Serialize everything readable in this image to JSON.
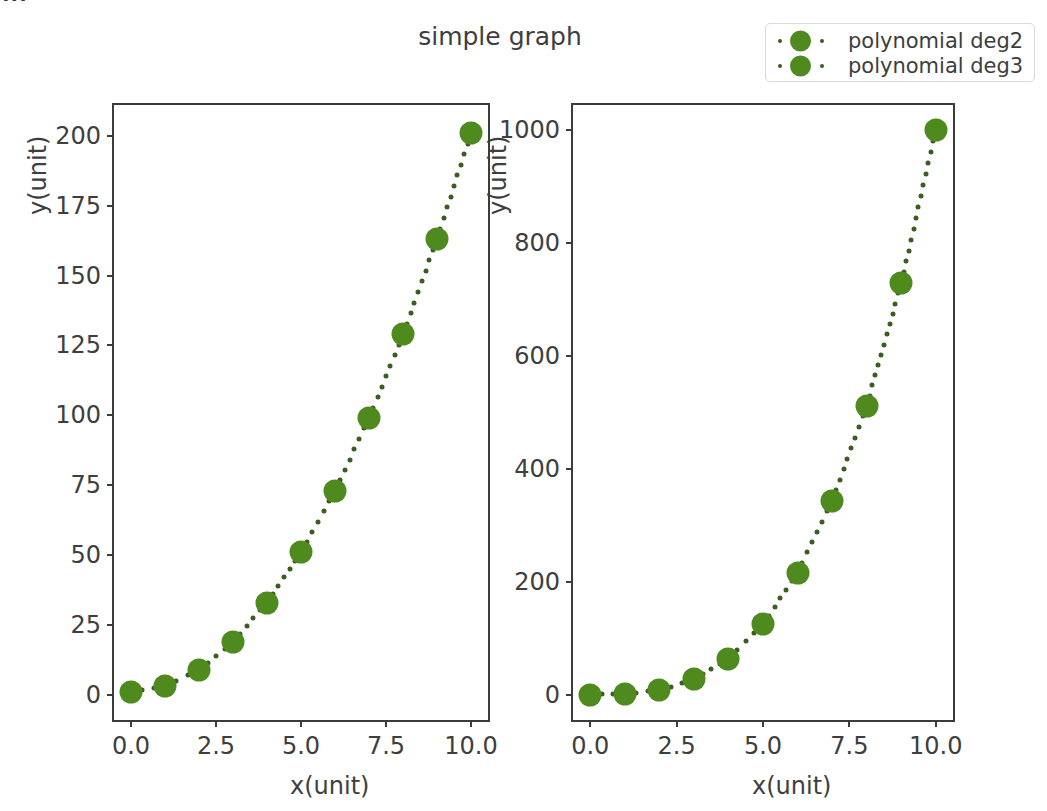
{
  "figure": {
    "suptitle": "simple graph",
    "clipped_top_text": "···",
    "marker_color": "#4f8a1f",
    "line_color": "#3b5c23",
    "axes_color": "#3c3c3c",
    "background": "#ffffff"
  },
  "legend": {
    "position": "upper right",
    "entries": [
      {
        "label": "polynomial deg2",
        "color": "#4f8a1f",
        "marker": "circle",
        "linestyle": "dotted"
      },
      {
        "label": "polynomial deg3",
        "color": "#4f8a1f",
        "marker": "circle",
        "linestyle": "dotted"
      }
    ]
  },
  "chart_data": [
    {
      "type": "scatter",
      "panel": "left",
      "title": "",
      "series_name": "polynomial deg2",
      "xlabel": "x(unit)",
      "ylabel": "y(unit)",
      "x": [
        0,
        1,
        2,
        3,
        4,
        5,
        6,
        7,
        8,
        9,
        10
      ],
      "values": [
        1,
        3,
        9,
        19,
        33,
        51,
        73,
        99,
        129,
        163,
        201
      ],
      "xlim": [
        -0.5,
        10.5
      ],
      "ylim": [
        -9,
        211
      ],
      "xticks": [
        0.0,
        2.5,
        5.0,
        7.5,
        10.0
      ],
      "xticklabels": [
        "0.0",
        "2.5",
        "5.0",
        "7.5",
        "10.0"
      ],
      "yticks": [
        0,
        25,
        50,
        75,
        100,
        125,
        150,
        175,
        200
      ],
      "yticklabels": [
        "0",
        "25",
        "50",
        "75",
        "100",
        "125",
        "150",
        "175",
        "200"
      ],
      "grid": false,
      "linestyle": "dotted",
      "marker": "circle",
      "color": "#4f8a1f"
    },
    {
      "type": "scatter",
      "panel": "right",
      "title": "",
      "series_name": "polynomial deg3",
      "xlabel": "x(unit)",
      "ylabel": "y(unit)",
      "x": [
        0,
        1,
        2,
        3,
        4,
        5,
        6,
        7,
        8,
        9,
        10
      ],
      "values": [
        0,
        1,
        8,
        27,
        64,
        125,
        216,
        343,
        512,
        729,
        1000
      ],
      "xlim": [
        -0.5,
        10.5
      ],
      "ylim": [
        -45,
        1045
      ],
      "xticks": [
        0.0,
        2.5,
        5.0,
        7.5,
        10.0
      ],
      "xticklabels": [
        "0.0",
        "2.5",
        "5.0",
        "7.5",
        "10.0"
      ],
      "yticks": [
        0,
        200,
        400,
        600,
        800,
        1000
      ],
      "yticklabels": [
        "0",
        "200",
        "400",
        "600",
        "800",
        "1000"
      ],
      "grid": false,
      "linestyle": "dotted",
      "marker": "circle",
      "color": "#4f8a1f"
    }
  ]
}
